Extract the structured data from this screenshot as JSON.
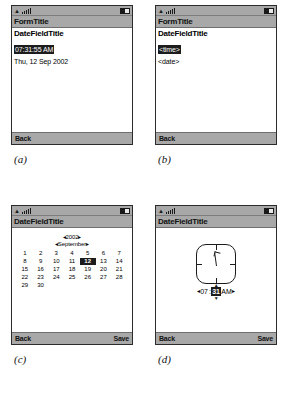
{
  "panels": [
    {
      "caption": "(a)",
      "statusbar": {
        "signal_icon": "signal-bars-icon",
        "battery_icon": "battery-icon"
      },
      "titlebar": "FormTitle",
      "field_title": "DateFieldTitle",
      "selected_value": "07:31:55 AM",
      "secondary_value": "Thu, 12 Sep 2002",
      "softkey_left": "Back",
      "softkey_right": ""
    },
    {
      "caption": "(b)",
      "statusbar": {
        "signal_icon": "signal-bars-icon",
        "battery_icon": "battery-icon"
      },
      "titlebar": "FormTitle",
      "field_title": "DateFieldTitle",
      "selected_value": "<time>",
      "secondary_value": "<date>",
      "softkey_left": "Back",
      "softkey_right": ""
    },
    {
      "caption": "(c)",
      "statusbar": {
        "signal_icon": "signal-bars-icon",
        "battery_icon": "battery-icon"
      },
      "titlebar": "DateFieldTitle",
      "softkey_left": "Back",
      "softkey_right": "Save",
      "calendar": {
        "year": "2002",
        "month": "September",
        "prev_arrow": "◂",
        "next_arrow": "▸",
        "selected_day": "12",
        "days": [
          "1",
          "2",
          "3",
          "4",
          "5",
          "6",
          "7",
          "8",
          "9",
          "10",
          "11",
          "12",
          "13",
          "14",
          "15",
          "16",
          "17",
          "18",
          "19",
          "20",
          "21",
          "22",
          "23",
          "24",
          "25",
          "26",
          "27",
          "28",
          "29",
          "30"
        ]
      }
    },
    {
      "caption": "(d)",
      "statusbar": {
        "signal_icon": "signal-bars-icon",
        "battery_icon": "battery-icon"
      },
      "titlebar": "DateFieldTitle",
      "softkey_left": "Back",
      "softkey_right": "Save",
      "clock": {
        "face_icon": "analog-clock-face-icon",
        "prev_arrow": "◂",
        "next_arrow": "▸",
        "hour": "07",
        "separator": ":",
        "minute": "31",
        "meridiem": "AM",
        "spinner_up": "▲",
        "spinner_down": "▼"
      }
    }
  ],
  "colors": {
    "chrome": "#a8a8a8",
    "selection": "#1c1c1c",
    "screen": "#ffffff",
    "border": "#2b2b2b"
  }
}
